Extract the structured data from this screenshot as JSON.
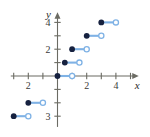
{
  "figure": {
    "kind": "step-function-graph",
    "background": "#ffffff",
    "axis_color": "#6b6b63",
    "segment_color": "#7fb2e5",
    "closed_dot_color": "#16213f",
    "open_dot_fill": "#ffffff",
    "open_dot_stroke": "#7fb2e5",
    "axis_labels": {
      "x": "x",
      "y": "y"
    },
    "x_tick_labels": [
      {
        "value": -2,
        "text": "2"
      },
      {
        "value": 2,
        "text": "2"
      },
      {
        "value": 4,
        "text": "4"
      }
    ],
    "y_tick_labels": [
      {
        "value": 4,
        "text": "4"
      },
      {
        "value": 2,
        "text": "2"
      },
      {
        "value": -3,
        "text": "3"
      }
    ]
  },
  "chart_data": {
    "type": "line",
    "title": "",
    "xlabel": "x",
    "ylabel": "y",
    "xlim": [
      -3.2,
      5.6
    ],
    "ylim": [
      -3.8,
      4.8
    ],
    "grid": false,
    "legend": "none",
    "x_ticks": [
      -3,
      -2,
      -1,
      0,
      1,
      2,
      3,
      4,
      5
    ],
    "y_ticks": [
      -3,
      -2,
      -1,
      0,
      1,
      2,
      3,
      4
    ],
    "x_tick_labels_shown": [
      "-2",
      "2",
      "4"
    ],
    "y_tick_labels_shown": [
      "4",
      "2",
      "-3"
    ],
    "series": [
      {
        "name": "step function",
        "style": "step-segments",
        "segments": [
          {
            "x_start": -3,
            "x_end": -2,
            "y": -3,
            "left_endpoint": "closed",
            "right_endpoint": "open"
          },
          {
            "x_start": -2,
            "x_end": -1,
            "y": -2,
            "left_endpoint": "closed",
            "right_endpoint": "open"
          },
          {
            "x_start": 0,
            "x_end": 1,
            "y": 0,
            "left_endpoint": "closed",
            "right_endpoint": "open"
          },
          {
            "x_start": 0.5,
            "x_end": 1.5,
            "y": 1,
            "left_endpoint": "closed",
            "right_endpoint": "open"
          },
          {
            "x_start": 1,
            "x_end": 2,
            "y": 2,
            "left_endpoint": "closed",
            "right_endpoint": "open"
          },
          {
            "x_start": 2,
            "x_end": 3,
            "y": 3,
            "left_endpoint": "closed",
            "right_endpoint": "open"
          },
          {
            "x_start": 3,
            "x_end": 4,
            "y": 4,
            "left_endpoint": "closed",
            "right_endpoint": "open"
          }
        ]
      }
    ]
  }
}
